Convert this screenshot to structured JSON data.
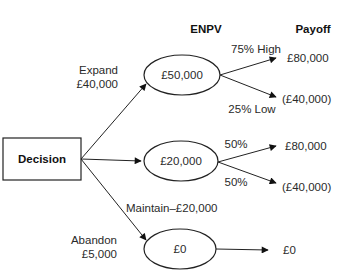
{
  "headers": {
    "enpv": "ENPV",
    "payoff": "Payoff"
  },
  "decision_node": {
    "label": "Decision"
  },
  "branches": [
    {
      "name": "expand",
      "label_line1": "Expand",
      "label_line2": "£40,000",
      "enpv": "£50,000",
      "outcomes": [
        {
          "label": "75% High",
          "payoff": "£80,000"
        },
        {
          "label": "25% Low",
          "payoff": "(£40,000)"
        }
      ]
    },
    {
      "name": "maintain",
      "label": "Maintain–£20,000",
      "enpv": "£20,000",
      "outcomes": [
        {
          "label": "50%",
          "payoff": "£80,000"
        },
        {
          "label": "50%",
          "payoff": "(£40,000)"
        }
      ]
    },
    {
      "name": "abandon",
      "label_line1": "Abandon",
      "label_line2": "£5,000",
      "enpv": "£0",
      "outcomes": [
        {
          "label": "",
          "payoff": "£0"
        }
      ]
    }
  ],
  "colors": {
    "stroke": "#222222",
    "background": "#ffffff"
  }
}
